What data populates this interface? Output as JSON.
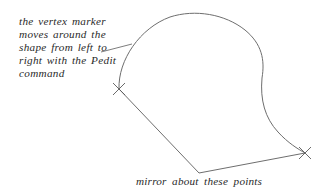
{
  "annotations": {
    "vertex_note": {
      "lines": [
        "the vertex marker",
        "moves around the",
        "shape from left to",
        "right with the Pedit",
        "command"
      ]
    },
    "mirror_caption": "mirror about these points"
  },
  "colors": {
    "line": "#6e6e6e",
    "text": "#2a2a2a",
    "background": "#ffffff"
  },
  "shapes": {
    "curve": "spline-arc",
    "polyline_vertex_left": [
      119,
      89
    ],
    "polyline_vertex_bottom": [
      199,
      173
    ],
    "polyline_vertex_right": [
      305,
      153
    ],
    "markers": [
      "x-marker-left",
      "x-marker-right"
    ]
  }
}
